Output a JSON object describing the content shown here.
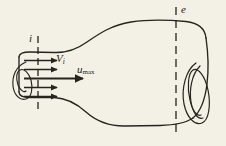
{
  "figure": {
    "background_color": "#f3f1e6",
    "ink_color": "#26241c",
    "width": 226,
    "height": 146,
    "labels": {
      "inlet_station": "i",
      "exit_station": "e",
      "inlet_velocity_base": "V",
      "inlet_velocity_sub": "i",
      "max_velocity_base": "u",
      "max_velocity_sub": "max"
    },
    "stations": [
      {
        "name": "inlet-station-line",
        "label": "i",
        "x": 38,
        "y_top": 36,
        "y_bottom": 112,
        "style": "dashed"
      },
      {
        "name": "exit-station-line",
        "label": "e",
        "x": 176,
        "y_top": 8,
        "y_bottom": 136,
        "style": "dashed"
      }
    ],
    "velocity_arrows": [
      {
        "index": 1,
        "y": 60,
        "x_start": 24,
        "x_end": 62,
        "weight": "thin"
      },
      {
        "index": 2,
        "y": 69,
        "x_start": 24,
        "x_end": 62,
        "weight": "thin"
      },
      {
        "index": 3,
        "y": 78,
        "x_start": 24,
        "x_end": 88,
        "weight": "thick"
      },
      {
        "index": 4,
        "y": 87,
        "x_start": 24,
        "x_end": 62,
        "weight": "thin"
      },
      {
        "index": 5,
        "y": 96,
        "x_start": 24,
        "x_end": 62,
        "weight": "thin"
      }
    ],
    "vortices": [
      {
        "name": "left-vortex",
        "side": "left",
        "turns": 2
      },
      {
        "name": "right-vortex",
        "side": "right",
        "turns": 2
      }
    ]
  }
}
